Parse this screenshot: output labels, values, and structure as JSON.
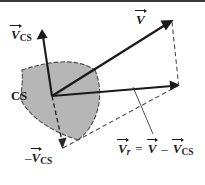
{
  "figure": {
    "name": "control-surface-relative-velocity-diagram",
    "background_color": "#ffffff",
    "ink_color": "#1a1a1a",
    "surface_fill_color": "#b6b6b6",
    "surface_edge_color": "#4a4a4a",
    "top_rule_color": "#3a3a3a"
  },
  "labels": {
    "velocity_cs": {
      "symbol": "V",
      "subscript": "CS",
      "full_text": "V⃗_CS",
      "meaning": "velocity-of-control-surface"
    },
    "velocity_absolute": {
      "symbol": "V",
      "subscript": "",
      "full_text": "V⃗",
      "meaning": "absolute-velocity"
    },
    "control_surface": {
      "text": "CS",
      "meaning": "control-surface"
    },
    "velocity_cs_negative": {
      "minus": "–",
      "symbol": "V",
      "subscript": "CS",
      "full_text": "–V⃗_CS",
      "meaning": "negative-velocity-of-control-surface"
    },
    "equation": {
      "lhs_symbol": "V",
      "lhs_subscript": "r",
      "equals": "=",
      "rhs_first_symbol": "V",
      "minus": "–",
      "rhs_second_symbol": "V",
      "rhs_second_subscript": "CS",
      "full_text": "V⃗_r = V⃗ – V⃗_CS",
      "meaning": "relative-velocity-equation"
    }
  },
  "geometry": {
    "origin": {
      "x": 52,
      "y": 96
    },
    "vectors": [
      {
        "name": "velocity-cs-vector",
        "style": "solid",
        "from": [
          52,
          96
        ],
        "to": [
          42,
          30
        ]
      },
      {
        "name": "absolute-velocity-vector",
        "style": "solid",
        "from": [
          52,
          96
        ],
        "to": [
          172,
          21
        ]
      },
      {
        "name": "relative-velocity-vector",
        "style": "solid",
        "from": [
          52,
          96
        ],
        "to": [
          178,
          85
        ]
      },
      {
        "name": "negative-velocity-cs-vector",
        "style": "dashed",
        "from": [
          52,
          96
        ],
        "to": [
          62,
          148
        ]
      }
    ],
    "construction_lines": [
      {
        "name": "dashed-vertical-closure",
        "from": [
          172,
          21
        ],
        "to": [
          178,
          85
        ]
      },
      {
        "name": "dashed-parallelogram-side",
        "from": [
          62,
          148
        ],
        "to": [
          178,
          85
        ]
      },
      {
        "name": "equation-leader-line",
        "from": [
          133,
          88
        ],
        "to": [
          153,
          135
        ]
      }
    ]
  }
}
